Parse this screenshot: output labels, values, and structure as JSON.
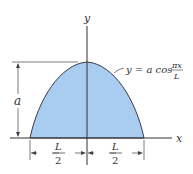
{
  "figure": {
    "axis_x_label": "x",
    "axis_y_label": "y",
    "height_label": "a",
    "equation": {
      "lhs": "y = a cos",
      "numerator": "πx",
      "denominator": "L"
    },
    "left_half_width": {
      "numerator": "L",
      "denominator": "2"
    },
    "right_half_width": {
      "numerator": "L",
      "denominator": "2"
    },
    "colors": {
      "fill": "#a9cdf0",
      "stroke": "#3a3a4a",
      "dimension": "#444444"
    }
  }
}
